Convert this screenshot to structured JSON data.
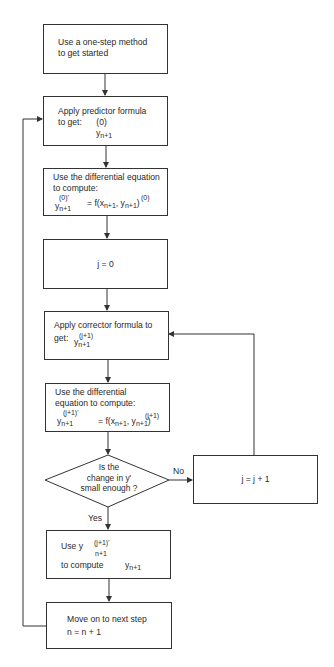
{
  "diagram": {
    "type": "flowchart",
    "nodes": {
      "start": {
        "line1": "Use a one-step method",
        "line2": "to get started"
      },
      "predictor": {
        "line1": "Apply predictor formula",
        "line2": "to get:",
        "sup": "(0)",
        "var": "y",
        "sub": "n+1"
      },
      "de_predict": {
        "line1": "Use the differential equation",
        "line2": "to compute:",
        "lhs_sup": "(0)'",
        "lhs_var": "y",
        "lhs_sub": "n+1",
        "rhs_prefix": "= f(x",
        "rhs_x_sub": "n+1",
        "rhs_mid": ", y",
        "rhs_sup": "(0)",
        "rhs_y_sub": "n+1",
        "rhs_close": ")"
      },
      "init_j": {
        "text": "j = 0"
      },
      "corrector": {
        "line1": "Apply corrector  formula to",
        "line2": "get:",
        "sup": "(j+1)",
        "var": "y",
        "sub": "n+1"
      },
      "de_correct": {
        "line1": "Use the differential",
        "line2": "equation to compute:",
        "lhs_sup": "(j+1)'",
        "lhs_var": "y",
        "lhs_sub": "n+1",
        "rhs_prefix": "= f(x",
        "rhs_x_sub": "n+1",
        "rhs_mid": ", y",
        "rhs_sup": "(j+1)",
        "rhs_y_sub": "n+1",
        "rhs_close": ")"
      },
      "decision": {
        "line1": "Is the",
        "line2": "change in y'",
        "line3": "small enough ?"
      },
      "increment_j": {
        "text": "j = j + 1"
      },
      "use_y": {
        "prefix": "Use y",
        "sup": "(j+1)'",
        "sub": "n+1",
        "line2": "to compute",
        "var": "y",
        "var_sub": "n+1"
      },
      "next_step": {
        "line1": "Move on to next step",
        "line2": "n = n + 1"
      }
    },
    "edge_labels": {
      "no": "No",
      "yes": "Yes"
    }
  }
}
